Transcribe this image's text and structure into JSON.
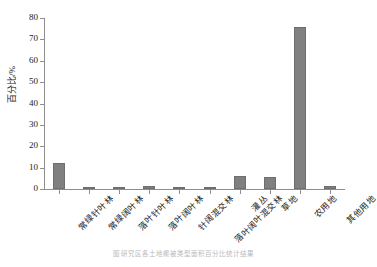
{
  "chart_data": {
    "type": "bar",
    "title": "",
    "xlabel": "",
    "ylabel": "百分比/%",
    "ylim": [
      0,
      80
    ],
    "yticks": [
      0,
      10,
      20,
      30,
      40,
      50,
      60,
      70,
      80
    ],
    "grid": false,
    "legend": null,
    "categories": [
      "常绿针叶林",
      "常绿阔叶林",
      "落叶针叶林",
      "落叶阔叶林",
      "针阔混交林",
      "落叶阔叶混交林",
      "灌丛",
      "草地",
      "农用地",
      "其他用地"
    ],
    "values": [
      12.2,
      0.1,
      0.1,
      1.5,
      0.1,
      0.1,
      6.1,
      5.7,
      75.7,
      1.3
    ],
    "bar_color": "#808080",
    "axis_color": "#8d8d8d"
  },
  "caption": {
    "text": "图  研究区各土地覆被类型面积百分比统计结果"
  }
}
